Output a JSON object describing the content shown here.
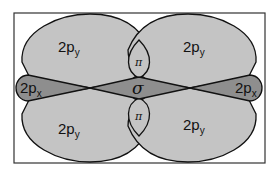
{
  "diagram": {
    "colors": {
      "frame": "#333333",
      "py_lobe": "#c4c4c4",
      "px_lobe": "#8e8e8e",
      "sigma_region": "#8e8e8e",
      "outline": "#111111"
    },
    "labels": {
      "py_upper_left": {
        "main": "2p",
        "sub": "y"
      },
      "py_upper_right": {
        "main": "2p",
        "sub": "y"
      },
      "py_lower_left": {
        "main": "2p",
        "sub": "y"
      },
      "py_lower_right": {
        "main": "2p",
        "sub": "y"
      },
      "px_left": {
        "main": "2p",
        "sub": "x"
      },
      "px_right": {
        "main": "2p",
        "sub": "x"
      },
      "sigma": "σ",
      "pi_upper": "π",
      "pi_lower": "π"
    }
  }
}
